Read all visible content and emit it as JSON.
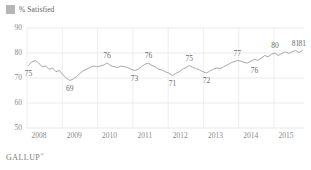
{
  "legend": {
    "swatch_color": "#b6b6b6",
    "label": "% Satisfied"
  },
  "footer": {
    "brand": "GALLUP",
    "mark": "®"
  },
  "chart_data": {
    "type": "line",
    "title": "",
    "subtitle": "",
    "xlabel": "",
    "ylabel": "",
    "ylim": [
      50,
      90
    ],
    "yticks": [
      90,
      80,
      70,
      60,
      50
    ],
    "xlim": [
      2008,
      2015.85
    ],
    "xticks": [
      2008,
      2009,
      2010,
      2011,
      2012,
      2013,
      2014,
      2015
    ],
    "xtick_labels": [
      "2008",
      "2009",
      "2010",
      "2011",
      "2012",
      "2013",
      "2014",
      "2015"
    ],
    "grid": true,
    "legend_position": "top-left",
    "line_color": "#a8a8a8",
    "series": [
      {
        "name": "% Satisfied",
        "x": [
          2008.04,
          2008.14,
          2008.24,
          2008.33,
          2008.43,
          2008.53,
          2008.62,
          2008.72,
          2008.82,
          2008.92,
          2009.01,
          2009.11,
          2009.21,
          2009.3,
          2009.4,
          2009.5,
          2009.6,
          2009.69,
          2009.79,
          2009.89,
          2009.98,
          2010.08,
          2010.18,
          2010.27,
          2010.37,
          2010.47,
          2010.57,
          2010.66,
          2010.76,
          2010.86,
          2010.95,
          2011.05,
          2011.15,
          2011.24,
          2011.34,
          2011.44,
          2011.54,
          2011.63,
          2011.73,
          2011.83,
          2011.92,
          2012.02,
          2012.12,
          2012.21,
          2012.31,
          2012.41,
          2012.51,
          2012.6,
          2012.7,
          2012.8,
          2012.89,
          2012.99,
          2013.09,
          2013.18,
          2013.28,
          2013.38,
          2013.48,
          2013.57,
          2013.67,
          2013.77,
          2013.86,
          2013.96,
          2014.06,
          2014.15,
          2014.25,
          2014.35,
          2014.45,
          2014.54,
          2014.64,
          2014.74,
          2014.83,
          2014.93,
          2015.03,
          2015.12,
          2015.22,
          2015.32,
          2015.42,
          2015.51,
          2015.61,
          2015.71,
          2015.8
        ],
        "values": [
          75,
          76.5,
          77,
          76,
          74.5,
          74.8,
          73.5,
          74,
          72.5,
          73,
          71.5,
          70,
          69,
          69.5,
          70.5,
          71.8,
          73,
          73.5,
          74.2,
          74.8,
          74.5,
          74.8,
          75.2,
          76,
          75,
          74.5,
          74.2,
          74.8,
          74.5,
          74.2,
          73.5,
          73,
          73.5,
          74.5,
          75.5,
          76,
          75,
          74.5,
          73.5,
          73.2,
          72.5,
          72,
          71,
          71.8,
          72.5,
          73.5,
          74.2,
          75,
          74.2,
          73.8,
          73.2,
          72.5,
          72,
          72.8,
          73.5,
          74,
          73.8,
          74.5,
          75.2,
          76,
          76.5,
          77,
          76.8,
          76.2,
          76,
          76.8,
          77.5,
          77,
          78,
          79,
          78.5,
          79.5,
          80,
          79,
          79.8,
          80.5,
          79.8,
          80.5,
          81,
          80.2,
          81
        ]
      }
    ],
    "point_labels": [
      {
        "text": "75",
        "x": 2008.04,
        "value": 75,
        "position": "below"
      },
      {
        "text": "69",
        "x": 2009.21,
        "value": 69,
        "position": "below"
      },
      {
        "text": "76",
        "x": 2010.27,
        "value": 76,
        "position": "above"
      },
      {
        "text": "73",
        "x": 2011.05,
        "value": 73,
        "position": "below"
      },
      {
        "text": "76",
        "x": 2011.44,
        "value": 76,
        "position": "above"
      },
      {
        "text": "71",
        "x": 2012.12,
        "value": 71,
        "position": "below"
      },
      {
        "text": "75",
        "x": 2012.6,
        "value": 75,
        "position": "above"
      },
      {
        "text": "72",
        "x": 2013.09,
        "value": 72,
        "position": "below"
      },
      {
        "text": "77",
        "x": 2013.96,
        "value": 77,
        "position": "above"
      },
      {
        "text": "76",
        "x": 2014.45,
        "value": 76,
        "position": "below"
      },
      {
        "text": "80",
        "x": 2015.03,
        "value": 80,
        "position": "above"
      },
      {
        "text": "81",
        "x": 2015.61,
        "value": 81,
        "position": "above"
      },
      {
        "text": "81",
        "x": 2015.8,
        "value": 81,
        "position": "above"
      }
    ]
  }
}
